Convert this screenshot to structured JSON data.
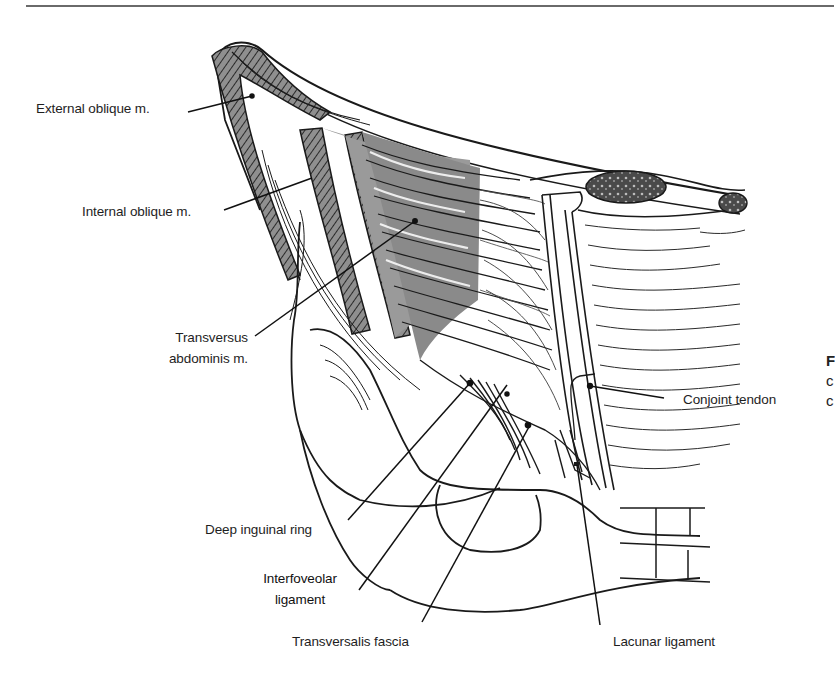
{
  "figure": {
    "type": "anatomical-illustration",
    "colors": {
      "line": "#1a1a1a",
      "muscle_shade": "#8f8f8f",
      "muscle_dark": "#3a3a3a",
      "background": "#ffffff"
    }
  },
  "labels": {
    "external_oblique": "External oblique m.",
    "internal_oblique": "Internal oblique m.",
    "transversus_line1": "Transversus",
    "transversus_line2": "abdominis m.",
    "deep_inguinal_ring": "Deep inguinal ring",
    "interfoveolar_line1": "Interfoveolar",
    "interfoveolar_line2": "ligament",
    "transversalis_fascia": "Transversalis fascia",
    "lacunar_ligament": "Lacunar ligament",
    "conjoint_tendon": "Conjoint tendon"
  },
  "caption_fragments": {
    "line1": "F",
    "line2": "c",
    "line3": "c"
  }
}
